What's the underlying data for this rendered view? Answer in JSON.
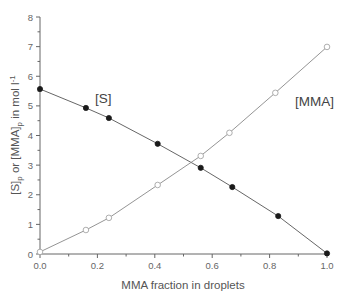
{
  "chart_data": {
    "type": "line",
    "title": "",
    "xlabel": "MMA fraction in droplets",
    "ylabel_parts": {
      "a": "[S]",
      "a_sub": "p",
      "mid": " or [MMA]",
      "b_sub": "p",
      "unit": " in mol l",
      "unit_sup": "-1"
    },
    "ylabel": "[S]p or [MMA]p in mol l-1",
    "xlim": [
      0.0,
      1.0
    ],
    "ylim": [
      0,
      8
    ],
    "x_ticks": [
      "0.0",
      "0.2",
      "0.4",
      "0.6",
      "0.8",
      "1.0"
    ],
    "y_ticks": [
      "0",
      "1",
      "2",
      "3",
      "4",
      "5",
      "6",
      "7",
      "8"
    ],
    "grid": false,
    "legend": "inline labels",
    "series": [
      {
        "name": "[S]",
        "marker": "filled-circle",
        "color": "#222222",
        "x": [
          0.0,
          0.16,
          0.24,
          0.41,
          0.56,
          0.67,
          0.83,
          1.0
        ],
        "y": [
          5.57,
          4.93,
          4.59,
          3.72,
          2.91,
          2.26,
          1.28,
          0.02
        ]
      },
      {
        "name": "[MMA]",
        "marker": "open-circle",
        "color": "#999999",
        "x": [
          0.0,
          0.16,
          0.24,
          0.41,
          0.56,
          0.66,
          0.82,
          1.0
        ],
        "y": [
          0.07,
          0.81,
          1.22,
          2.33,
          3.31,
          4.09,
          5.44,
          6.99
        ]
      }
    ]
  },
  "labels": {
    "series_s": "[S]",
    "series_mma": "[MMA]"
  }
}
